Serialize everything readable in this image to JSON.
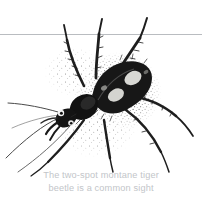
{
  "page": {
    "background_color": "#ffffff",
    "width": 202,
    "height": 207,
    "kind": "field-guide-illustration-plate"
  },
  "horizon": {
    "name": "horizon-rule",
    "color": "#b9bcc0",
    "y": 34
  },
  "illustration": {
    "subject": "two-spot montane tiger beetle",
    "style": "stippled pen-and-ink engraving",
    "ink_color": "#1a1a1a",
    "stipple_color": "#3a3a3a",
    "spot_color": "#d8d8d4",
    "leg_color": "#555555",
    "description": "Dorsal view of a dark tiger beetle angled head-down-left, with two pale spots on the elytra, six spined legs and two long antennae sweeping to the left, surrounded by stippled shading."
  },
  "caption": {
    "name": "figure-caption",
    "color": "#c2c5c9",
    "line1": "The two-spot montane tiger",
    "line2": "beetle is a common sight",
    "full_text": "The two-spot montane tiger beetle is a common sight"
  }
}
